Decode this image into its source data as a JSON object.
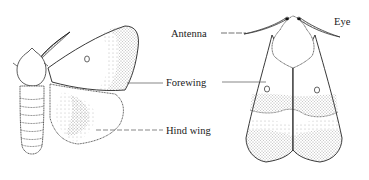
{
  "figure": {
    "type": "diagram",
    "views": [
      "side view (wings spread)",
      "dorsal view (wings folded)"
    ]
  },
  "labels": {
    "antenna": "Antenna",
    "eye": "Eye",
    "forewing": "Forewing",
    "hind_wing": "Hind wing"
  },
  "colors": {
    "ink": "#1a1a1a",
    "stipple": "#555555",
    "background": "#ffffff"
  }
}
